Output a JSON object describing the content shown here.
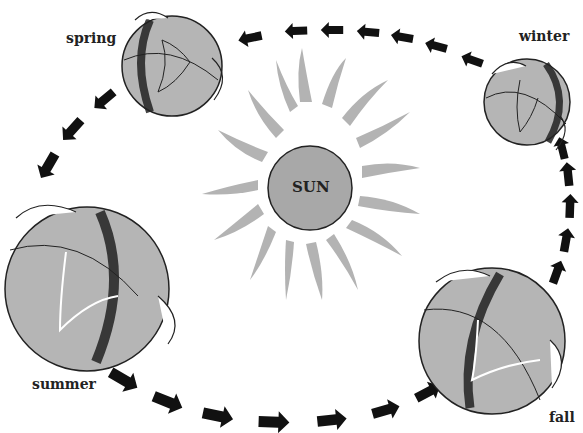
{
  "diagram": {
    "center": {
      "label": "SUN",
      "cx": 310,
      "cy": 188,
      "r": 42,
      "fill": "#a8a8a8",
      "ray_color": "#b0b0b0"
    },
    "seasons": [
      {
        "id": "spring",
        "label": "spring",
        "label_x": 66,
        "label_y": 42,
        "globe": {
          "cx": 172,
          "cy": 66,
          "r": 50
        }
      },
      {
        "id": "winter",
        "label": "winter",
        "label_x": 519,
        "label_y": 40,
        "globe": {
          "cx": 527,
          "cy": 102,
          "r": 43
        }
      },
      {
        "id": "fall",
        "label": "fall",
        "label_x": 549,
        "label_y": 421,
        "globe": {
          "cx": 492,
          "cy": 341,
          "r": 73
        }
      },
      {
        "id": "summer",
        "label": "summer",
        "label_x": 32,
        "label_y": 388,
        "globe": {
          "cx": 87,
          "cy": 289,
          "r": 82
        }
      }
    ],
    "orbit_direction": "winter → spring → summer → fall → winter (counterclockwise as drawn)",
    "colors": {
      "globe_fill": "#b5b5b5",
      "globe_shadow": "#2a2a2a",
      "arrow": "#111111",
      "background": "#ffffff"
    }
  }
}
